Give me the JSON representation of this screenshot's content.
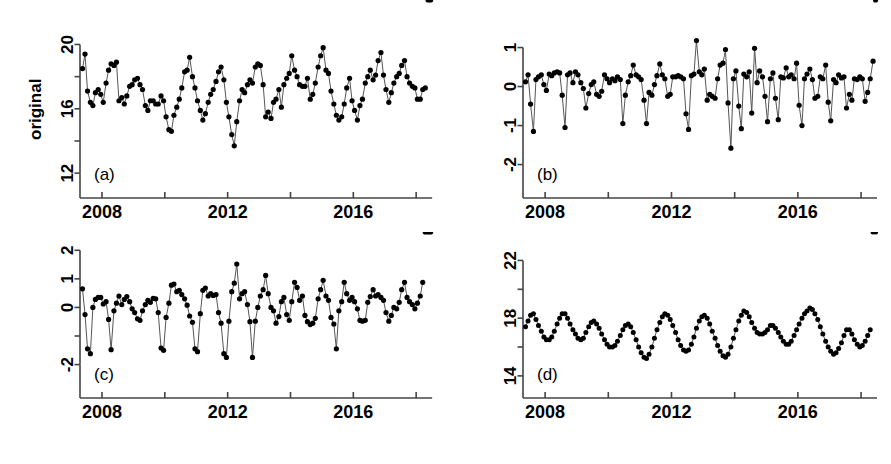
{
  "figure": {
    "background": "#ffffff",
    "line_color": "#555555",
    "point_color": "#000000",
    "axis_color": "#444444",
    "ylabel": "original"
  },
  "chart_data": [
    {
      "type": "line",
      "panel_tag": "(a)",
      "title": "",
      "xlabel": "",
      "ylabel": "original",
      "xlim": [
        2007.3,
        2018.6
      ],
      "ylim": [
        11.2,
        20.9
      ],
      "yticks": [
        12,
        16,
        20
      ],
      "ytick_labels": [
        "12",
        "16",
        "20"
      ],
      "yticks_minor": [
        14,
        18
      ],
      "xticks": [
        2008,
        2010,
        2012,
        2014,
        2016,
        2018
      ],
      "xtick_labels": [
        "2008",
        "",
        "2012",
        "",
        "2016",
        ""
      ],
      "grid": false,
      "legend": "none",
      "x": [
        2007.38,
        2007.46,
        2007.54,
        2007.63,
        2007.71,
        2007.79,
        2007.88,
        2007.96,
        2008.04,
        2008.13,
        2008.21,
        2008.29,
        2008.38,
        2008.46,
        2008.54,
        2008.63,
        2008.71,
        2008.79,
        2008.88,
        2008.96,
        2009.04,
        2009.13,
        2009.21,
        2009.29,
        2009.38,
        2009.46,
        2009.54,
        2009.63,
        2009.71,
        2009.79,
        2009.88,
        2009.96,
        2010.04,
        2010.13,
        2010.21,
        2010.29,
        2010.38,
        2010.46,
        2010.54,
        2010.63,
        2010.71,
        2010.79,
        2010.88,
        2010.96,
        2011.04,
        2011.13,
        2011.21,
        2011.29,
        2011.38,
        2011.46,
        2011.54,
        2011.63,
        2011.71,
        2011.79,
        2011.88,
        2011.96,
        2012.04,
        2012.13,
        2012.21,
        2012.29,
        2012.38,
        2012.46,
        2012.54,
        2012.63,
        2012.71,
        2012.79,
        2012.88,
        2012.96,
        2013.04,
        2013.13,
        2013.21,
        2013.29,
        2013.38,
        2013.46,
        2013.54,
        2013.63,
        2013.71,
        2013.79,
        2013.88,
        2013.96,
        2014.04,
        2014.13,
        2014.21,
        2014.29,
        2014.38,
        2014.46,
        2014.54,
        2014.63,
        2014.71,
        2014.79,
        2014.88,
        2014.96,
        2015.04,
        2015.13,
        2015.21,
        2015.29,
        2015.38,
        2015.46,
        2015.54,
        2015.63,
        2015.71,
        2015.79,
        2015.88,
        2015.96,
        2016.04,
        2016.13,
        2016.21,
        2016.29,
        2016.38,
        2016.46,
        2016.54,
        2016.63,
        2016.71,
        2016.79,
        2016.88,
        2016.96,
        2017.04,
        2017.13,
        2017.21,
        2017.29,
        2017.38,
        2017.46,
        2017.54,
        2017.63,
        2017.71,
        2017.79,
        2017.88,
        2017.96,
        2018.04,
        2018.13,
        2018.21,
        2018.29,
        2018.38,
        2018.46
      ],
      "y": [
        18.5,
        19.4,
        17.1,
        16.4,
        16.2,
        17.0,
        17.2,
        16.9,
        16.4,
        17.6,
        18.4,
        18.8,
        18.7,
        18.9,
        16.5,
        16.7,
        16.3,
        16.8,
        17.4,
        17.5,
        17.8,
        17.9,
        17.5,
        17.2,
        16.2,
        15.9,
        16.5,
        16.5,
        16.3,
        16.3,
        16.8,
        16.5,
        15.5,
        14.7,
        14.6,
        15.6,
        16.1,
        16.6,
        17.3,
        18.3,
        18.4,
        19.2,
        18.0,
        17.3,
        16.5,
        15.9,
        15.3,
        15.7,
        16.4,
        16.9,
        17.2,
        17.7,
        18.3,
        18.6,
        17.8,
        16.4,
        15.5,
        14.4,
        13.7,
        15.2,
        16.5,
        17.2,
        17.0,
        17.5,
        17.8,
        17.6,
        18.6,
        18.8,
        18.7,
        17.5,
        15.5,
        15.8,
        15.4,
        16.4,
        16.6,
        17.2,
        16.1,
        17.5,
        17.9,
        18.2,
        19.3,
        18.4,
        18.0,
        17.5,
        17.4,
        17.4,
        17.9,
        16.6,
        16.9,
        17.6,
        18.6,
        19.3,
        19.8,
        18.4,
        18.2,
        17.1,
        16.3,
        15.6,
        15.3,
        15.5,
        16.3,
        17.3,
        17.9,
        16.5,
        15.9,
        15.3,
        16.2,
        16.6,
        17.6,
        18.0,
        18.4,
        17.8,
        18.1,
        19.0,
        19.5,
        18.1,
        17.2,
        16.4,
        17.0,
        17.6,
        18.0,
        18.2,
        18.7,
        19.0,
        18.0,
        17.6,
        17.4,
        17.3,
        16.6,
        16.6,
        17.2,
        17.3
      ]
    },
    {
      "type": "line",
      "panel_tag": "(b)",
      "title": "",
      "xlabel": "",
      "ylabel": "",
      "xlim": [
        2007.3,
        2018.6
      ],
      "ylim": [
        -2.55,
        1.45
      ],
      "yticks": [
        -2,
        -1,
        0,
        1
      ],
      "ytick_labels": [
        "-2",
        "-1",
        "0",
        "1"
      ],
      "yticks_minor": [],
      "xticks": [
        2008,
        2010,
        2012,
        2014,
        2016,
        2018
      ],
      "xtick_labels": [
        "2008",
        "",
        "2012",
        "",
        "2016",
        ""
      ],
      "grid": false,
      "legend": "none",
      "x": [
        2007.38,
        2007.46,
        2007.54,
        2007.63,
        2007.71,
        2007.79,
        2007.88,
        2007.96,
        2008.04,
        2008.13,
        2008.21,
        2008.29,
        2008.38,
        2008.46,
        2008.54,
        2008.63,
        2008.71,
        2008.79,
        2008.88,
        2008.96,
        2009.04,
        2009.13,
        2009.21,
        2009.29,
        2009.38,
        2009.46,
        2009.54,
        2009.63,
        2009.71,
        2009.79,
        2009.88,
        2009.96,
        2010.04,
        2010.13,
        2010.21,
        2010.29,
        2010.38,
        2010.46,
        2010.54,
        2010.63,
        2010.71,
        2010.79,
        2010.88,
        2010.96,
        2011.04,
        2011.13,
        2011.21,
        2011.29,
        2011.38,
        2011.46,
        2011.54,
        2011.63,
        2011.71,
        2011.79,
        2011.88,
        2011.96,
        2012.04,
        2012.13,
        2012.21,
        2012.29,
        2012.38,
        2012.46,
        2012.54,
        2012.63,
        2012.71,
        2012.79,
        2012.88,
        2012.96,
        2013.04,
        2013.13,
        2013.21,
        2013.29,
        2013.38,
        2013.46,
        2013.54,
        2013.63,
        2013.71,
        2013.79,
        2013.88,
        2013.96,
        2014.04,
        2014.13,
        2014.21,
        2014.29,
        2014.38,
        2014.46,
        2014.54,
        2014.63,
        2014.71,
        2014.79,
        2014.88,
        2014.96,
        2015.04,
        2015.13,
        2015.21,
        2015.29,
        2015.38,
        2015.46,
        2015.54,
        2015.63,
        2015.71,
        2015.79,
        2015.88,
        2015.96,
        2016.04,
        2016.13,
        2016.21,
        2016.29,
        2016.38,
        2016.46,
        2016.54,
        2016.63,
        2016.71,
        2016.79,
        2016.88,
        2016.96,
        2017.04,
        2017.13,
        2017.21,
        2017.29,
        2017.38,
        2017.46,
        2017.54,
        2017.63,
        2017.71,
        2017.79,
        2017.88,
        2017.96,
        2018.04,
        2018.13,
        2018.21,
        2018.29,
        2018.38,
        2018.46
      ],
      "y": [
        0.12,
        0.3,
        -0.45,
        -1.15,
        0.18,
        0.25,
        0.3,
        0.05,
        -0.1,
        0.32,
        0.28,
        0.35,
        0.38,
        0.35,
        -0.22,
        -1.05,
        0.3,
        0.35,
        0.1,
        0.38,
        0.3,
        0.1,
        -0.05,
        -0.55,
        -0.18,
        0.05,
        0.12,
        -0.2,
        -0.25,
        -0.12,
        0.3,
        0.2,
        0.1,
        0.2,
        0.15,
        0.25,
        0.18,
        -0.95,
        -0.22,
        0.12,
        0.28,
        0.55,
        0.3,
        0.25,
        0.18,
        -0.35,
        -0.95,
        -0.15,
        -0.22,
        0.05,
        0.28,
        0.58,
        0.3,
        0.2,
        -0.25,
        -0.2,
        0.25,
        0.25,
        0.28,
        0.25,
        0.2,
        -0.7,
        -1.1,
        0.28,
        0.32,
        1.18,
        0.38,
        0.3,
        0.45,
        -0.35,
        -0.2,
        -0.25,
        -0.3,
        0.2,
        0.55,
        0.6,
        0.95,
        -0.42,
        -1.58,
        0.2,
        0.4,
        -0.5,
        -1.08,
        0.32,
        0.25,
        0.38,
        -0.68,
        0.98,
        0.1,
        0.4,
        0.25,
        -0.25,
        -0.9,
        0.2,
        0.35,
        -0.3,
        -0.85,
        0.25,
        0.22,
        0.48,
        0.25,
        0.3,
        0.2,
        0.6,
        -0.48,
        -1.0,
        0.2,
        0.32,
        0.45,
        0.18,
        -0.3,
        -0.25,
        0.25,
        0.2,
        0.55,
        -0.4,
        -0.88,
        0.18,
        0.1,
        0.3,
        0.22,
        0.25,
        -0.55,
        -0.2,
        -0.35,
        0.2,
        0.18,
        0.25,
        0.2,
        -0.38,
        -0.15,
        0.2,
        0.65
      ]
    },
    {
      "type": "line",
      "panel_tag": "(c)",
      "title": "",
      "xlabel": "",
      "ylabel": "",
      "xlim": [
        2007.3,
        2018.6
      ],
      "ylim": [
        -2.75,
        2.15
      ],
      "yticks": [
        -2,
        -1,
        0,
        1,
        2
      ],
      "ytick_labels": [
        "-2",
        "",
        "0",
        "1",
        "2"
      ],
      "yticks_minor": [],
      "xticks": [
        2008,
        2010,
        2012,
        2014,
        2016,
        2018
      ],
      "xtick_labels": [
        "2008",
        "",
        "2012",
        "",
        "2016",
        ""
      ],
      "grid": false,
      "legend": "none",
      "x": [
        2007.38,
        2007.46,
        2007.54,
        2007.63,
        2007.71,
        2007.79,
        2007.88,
        2007.96,
        2008.04,
        2008.13,
        2008.21,
        2008.29,
        2008.38,
        2008.46,
        2008.54,
        2008.63,
        2008.71,
        2008.79,
        2008.88,
        2008.96,
        2009.04,
        2009.13,
        2009.21,
        2009.29,
        2009.38,
        2009.46,
        2009.54,
        2009.63,
        2009.71,
        2009.79,
        2009.88,
        2009.96,
        2010.04,
        2010.13,
        2010.21,
        2010.29,
        2010.38,
        2010.46,
        2010.54,
        2010.63,
        2010.71,
        2010.79,
        2010.88,
        2010.96,
        2011.04,
        2011.13,
        2011.21,
        2011.29,
        2011.38,
        2011.46,
        2011.54,
        2011.63,
        2011.71,
        2011.79,
        2011.88,
        2011.96,
        2012.04,
        2012.13,
        2012.21,
        2012.29,
        2012.38,
        2012.46,
        2012.54,
        2012.63,
        2012.71,
        2012.79,
        2012.88,
        2012.96,
        2013.04,
        2013.13,
        2013.21,
        2013.29,
        2013.38,
        2013.46,
        2013.54,
        2013.63,
        2013.71,
        2013.79,
        2013.88,
        2013.96,
        2014.04,
        2014.13,
        2014.21,
        2014.29,
        2014.38,
        2014.46,
        2014.54,
        2014.63,
        2014.71,
        2014.79,
        2014.88,
        2014.96,
        2015.04,
        2015.13,
        2015.21,
        2015.29,
        2015.38,
        2015.46,
        2015.54,
        2015.63,
        2015.71,
        2015.79,
        2015.88,
        2015.96,
        2016.04,
        2016.13,
        2016.21,
        2016.29,
        2016.38,
        2016.46,
        2016.54,
        2016.63,
        2016.71,
        2016.79,
        2016.88,
        2016.96,
        2017.04,
        2017.13,
        2017.21,
        2017.29,
        2017.38,
        2017.46,
        2017.54,
        2017.63,
        2017.71,
        2017.79,
        2017.88,
        2017.96,
        2018.04,
        2018.13,
        2018.21,
        2018.29,
        2018.38,
        2018.46
      ],
      "y": [
        0.65,
        -0.25,
        -1.45,
        -1.62,
        0.0,
        0.28,
        0.35,
        0.35,
        0.12,
        0.2,
        -0.42,
        -1.48,
        -0.12,
        0.15,
        0.4,
        0.1,
        0.28,
        0.38,
        0.2,
        -0.05,
        -0.18,
        -0.4,
        -0.45,
        -0.12,
        0.1,
        0.25,
        0.18,
        0.32,
        0.3,
        -0.18,
        -1.42,
        -1.5,
        -0.35,
        0.15,
        0.78,
        0.82,
        0.55,
        0.6,
        0.45,
        0.3,
        0.08,
        -0.3,
        -0.52,
        -1.45,
        -1.55,
        -0.22,
        0.6,
        0.68,
        0.4,
        0.48,
        0.42,
        0.45,
        -0.18,
        -0.55,
        -1.62,
        -1.75,
        -0.48,
        0.55,
        0.85,
        1.52,
        0.3,
        0.48,
        0.55,
        0.1,
        -0.5,
        -1.75,
        -0.48,
        0.0,
        0.4,
        0.62,
        1.12,
        0.48,
        0.0,
        -0.12,
        -0.55,
        -0.32,
        0.2,
        0.35,
        -0.25,
        -0.45,
        0.2,
        0.88,
        0.7,
        0.25,
        0.4,
        -0.28,
        -0.5,
        -0.6,
        -0.55,
        -0.38,
        0.3,
        0.62,
        0.95,
        0.4,
        0.25,
        -0.35,
        -0.58,
        -1.45,
        -0.12,
        0.2,
        0.88,
        0.48,
        0.25,
        0.35,
        0.2,
        -0.05,
        -0.45,
        -0.48,
        -0.45,
        0.18,
        0.38,
        0.62,
        0.4,
        0.45,
        0.35,
        0.25,
        -0.18,
        -0.48,
        -0.28,
        0.0,
        -0.05,
        0.18,
        0.62,
        0.88,
        0.35,
        0.2,
        0.1,
        -0.05,
        0.15,
        0.4,
        0.88
      ]
    },
    {
      "type": "line",
      "panel_tag": "(d)",
      "title": "",
      "xlabel": "",
      "ylabel": "",
      "xlim": [
        2007.3,
        2018.6
      ],
      "ylim": [
        13.3,
        23.0
      ],
      "yticks": [
        14,
        18,
        22
      ],
      "ytick_labels": [
        "14",
        "18",
        "22"
      ],
      "yticks_minor": [
        16,
        20
      ],
      "xticks": [
        2008,
        2010,
        2012,
        2014,
        2016,
        2018
      ],
      "xtick_labels": [
        "2008",
        "",
        "2012",
        "",
        "2016",
        ""
      ],
      "grid": false,
      "legend": "none",
      "x": [
        2007.38,
        2007.46,
        2007.54,
        2007.63,
        2007.71,
        2007.79,
        2007.88,
        2007.96,
        2008.04,
        2008.13,
        2008.21,
        2008.29,
        2008.38,
        2008.46,
        2008.54,
        2008.63,
        2008.71,
        2008.79,
        2008.88,
        2008.96,
        2009.04,
        2009.13,
        2009.21,
        2009.29,
        2009.38,
        2009.46,
        2009.54,
        2009.63,
        2009.71,
        2009.79,
        2009.88,
        2009.96,
        2010.04,
        2010.13,
        2010.21,
        2010.29,
        2010.38,
        2010.46,
        2010.54,
        2010.63,
        2010.71,
        2010.79,
        2010.88,
        2010.96,
        2011.04,
        2011.13,
        2011.21,
        2011.29,
        2011.38,
        2011.46,
        2011.54,
        2011.63,
        2011.71,
        2011.79,
        2011.88,
        2011.96,
        2012.04,
        2012.13,
        2012.21,
        2012.29,
        2012.38,
        2012.46,
        2012.54,
        2012.63,
        2012.71,
        2012.79,
        2012.88,
        2012.96,
        2013.04,
        2013.13,
        2013.21,
        2013.29,
        2013.38,
        2013.46,
        2013.54,
        2013.63,
        2013.71,
        2013.79,
        2013.88,
        2013.96,
        2014.04,
        2014.13,
        2014.21,
        2014.29,
        2014.38,
        2014.46,
        2014.54,
        2014.63,
        2014.71,
        2014.79,
        2014.88,
        2014.96,
        2015.04,
        2015.13,
        2015.21,
        2015.29,
        2015.38,
        2015.46,
        2015.54,
        2015.63,
        2015.71,
        2015.79,
        2015.88,
        2015.96,
        2016.04,
        2016.13,
        2016.21,
        2016.29,
        2016.38,
        2016.46,
        2016.54,
        2016.63,
        2016.71,
        2016.79,
        2016.88,
        2016.96,
        2017.04,
        2017.13,
        2017.21,
        2017.29,
        2017.38,
        2017.46,
        2017.54,
        2017.63,
        2017.71,
        2017.79,
        2017.88,
        2017.96,
        2018.04,
        2018.13,
        2018.21,
        2018.29,
        2018.38,
        2018.46
      ],
      "y": [
        17.4,
        17.8,
        18.2,
        18.3,
        17.9,
        17.5,
        17.1,
        16.7,
        16.5,
        16.5,
        16.7,
        17.1,
        17.6,
        18.0,
        18.3,
        18.3,
        18.0,
        17.6,
        17.2,
        16.9,
        16.6,
        16.5,
        16.6,
        17.0,
        17.4,
        17.7,
        17.8,
        17.6,
        17.3,
        16.9,
        16.5,
        16.2,
        16.0,
        16.0,
        16.1,
        16.4,
        16.8,
        17.2,
        17.5,
        17.6,
        17.4,
        17.0,
        16.5,
        16.0,
        15.6,
        15.3,
        15.2,
        15.5,
        16.0,
        16.6,
        17.2,
        17.7,
        18.1,
        18.3,
        18.2,
        17.9,
        17.5,
        17.0,
        16.5,
        16.1,
        15.8,
        15.7,
        15.8,
        16.2,
        16.7,
        17.3,
        17.8,
        18.1,
        18.2,
        18.0,
        17.6,
        17.1,
        16.6,
        16.1,
        15.7,
        15.4,
        15.3,
        15.5,
        16.0,
        16.6,
        17.2,
        17.8,
        18.2,
        18.5,
        18.4,
        18.1,
        17.7,
        17.3,
        17.0,
        16.9,
        16.9,
        17.0,
        17.2,
        17.5,
        17.5,
        17.3,
        17.0,
        16.7,
        16.4,
        16.2,
        16.2,
        16.4,
        16.8,
        17.2,
        17.6,
        18.0,
        18.3,
        18.5,
        18.7,
        18.6,
        18.3,
        17.9,
        17.4,
        16.9,
        16.4,
        16.0,
        15.7,
        15.5,
        15.6,
        15.9,
        16.3,
        16.8,
        17.2,
        17.2,
        16.9,
        16.5,
        16.2,
        16.0,
        16.1,
        16.4,
        16.8,
        17.2
      ]
    }
  ]
}
